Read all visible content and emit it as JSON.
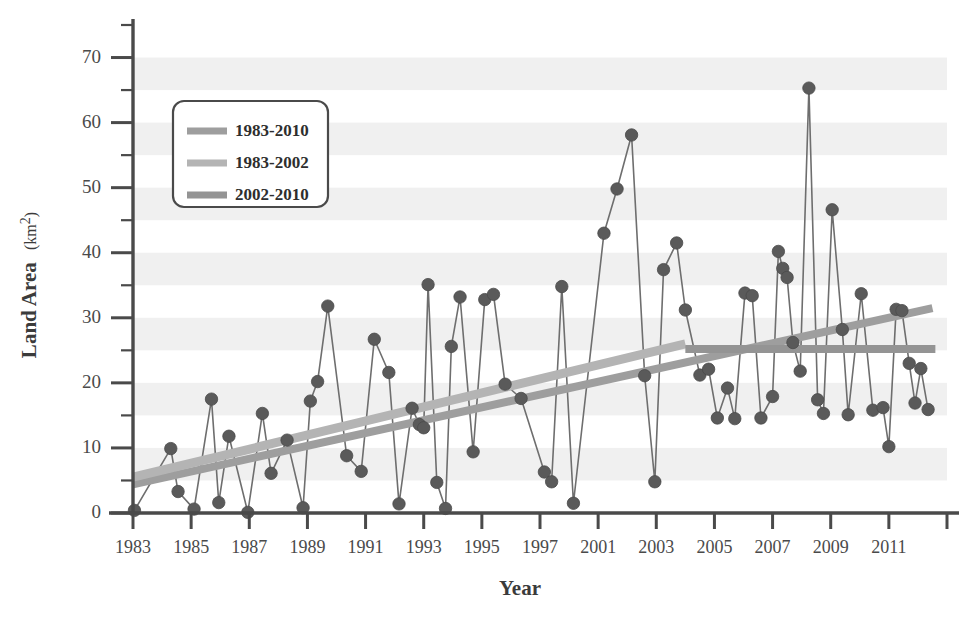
{
  "chart_data": {
    "type": "line",
    "title": "",
    "xlabel": "Year",
    "ylabel": "Land Area (km²)",
    "ylabel_main": "Land Area",
    "ylabel_unit": "(km",
    "ylabel_sup": "2",
    "ylabel_unit_close": ")",
    "xlim": [
      1983,
      2011
    ],
    "ylim": [
      0,
      75
    ],
    "yticks": [
      0,
      10,
      20,
      30,
      40,
      50,
      60,
      70
    ],
    "ytick_labels": [
      "0",
      "10",
      "20",
      "30",
      "40",
      "50",
      "60",
      "70"
    ],
    "yminor_step": 5,
    "xticks": [
      1983,
      1985,
      1987,
      1989,
      1991,
      1993,
      1995,
      1997,
      1999,
      2001,
      2003,
      2005,
      2007,
      2009,
      2011
    ],
    "xtick_labels": [
      "1983",
      "1985",
      "1987",
      "1989",
      "1991",
      "1993",
      "1995",
      "1997",
      "2001",
      "2003",
      "2005",
      "2007",
      "2009",
      "2011"
    ],
    "grid": "horizontal-bands",
    "band_color": "#f0f0f0",
    "marker_color": "#5a5a5a",
    "line_color": "#6e6e6e",
    "axis_color": "#4a4a4a",
    "legend_position": "top-left",
    "series": [
      {
        "name": "observations",
        "marker": "circle",
        "points": [
          [
            1983.05,
            0.4
          ],
          [
            1984.3,
            9.9
          ],
          [
            1984.55,
            3.3
          ],
          [
            1985.1,
            0.6
          ],
          [
            1985.7,
            17.5
          ],
          [
            1985.95,
            1.6
          ],
          [
            1986.3,
            11.8
          ],
          [
            1986.95,
            0.1
          ],
          [
            1987.45,
            15.3
          ],
          [
            1987.75,
            6.1
          ],
          [
            1988.3,
            11.2
          ],
          [
            1988.85,
            0.8
          ],
          [
            1989.1,
            17.2
          ],
          [
            1989.35,
            20.2
          ],
          [
            1989.7,
            31.8
          ],
          [
            1990.35,
            8.8
          ],
          [
            1990.85,
            6.4
          ],
          [
            1991.3,
            26.7
          ],
          [
            1991.8,
            21.6
          ],
          [
            1992.15,
            1.4
          ],
          [
            1992.6,
            16.1
          ],
          [
            1992.85,
            13.6
          ],
          [
            1993.0,
            13.1
          ],
          [
            1993.15,
            35.1
          ],
          [
            1993.45,
            4.7
          ],
          [
            1993.75,
            0.7
          ],
          [
            1993.95,
            25.6
          ],
          [
            1994.25,
            33.2
          ],
          [
            1994.7,
            9.4
          ],
          [
            1995.1,
            32.8
          ],
          [
            1995.4,
            33.6
          ],
          [
            1995.8,
            19.8
          ],
          [
            1996.35,
            17.6
          ],
          [
            1997.15,
            6.3
          ],
          [
            1997.4,
            4.8
          ],
          [
            1997.75,
            34.8
          ],
          [
            1998.15,
            1.5
          ],
          [
            1999.2,
            43.0
          ],
          [
            1999.65,
            49.8
          ],
          [
            2000.15,
            58.1
          ],
          [
            2000.6,
            21.1
          ],
          [
            2000.95,
            4.8
          ],
          [
            2001.25,
            37.4
          ],
          [
            2001.7,
            41.5
          ],
          [
            2002.0,
            31.2
          ],
          [
            2002.5,
            21.2
          ],
          [
            2002.8,
            22.1
          ],
          [
            2003.1,
            14.6
          ],
          [
            2003.45,
            19.2
          ],
          [
            2003.7,
            14.5
          ],
          [
            2004.05,
            33.8
          ],
          [
            2004.3,
            33.4
          ],
          [
            2004.6,
            14.6
          ],
          [
            2005.0,
            17.9
          ],
          [
            2005.2,
            40.2
          ],
          [
            2005.35,
            37.6
          ],
          [
            2005.5,
            36.2
          ],
          [
            2005.7,
            26.2
          ],
          [
            2005.95,
            21.8
          ],
          [
            2006.25,
            65.3
          ],
          [
            2006.55,
            17.4
          ],
          [
            2006.75,
            15.3
          ],
          [
            2007.05,
            46.6
          ],
          [
            2007.4,
            28.2
          ],
          [
            2007.6,
            15.1
          ],
          [
            2008.05,
            33.7
          ],
          [
            2008.45,
            15.8
          ],
          [
            2008.8,
            16.2
          ],
          [
            2009.0,
            10.2
          ],
          [
            2009.25,
            31.3
          ],
          [
            2009.45,
            31.1
          ],
          [
            2009.7,
            23.0
          ],
          [
            2009.9,
            16.9
          ],
          [
            2010.1,
            22.2
          ],
          [
            2010.35,
            15.9
          ]
        ]
      }
    ],
    "trend_lines": [
      {
        "name": "1983-2010",
        "label": "1983-2010",
        "color": "#9e9e9e",
        "x_start": 1983,
        "y_start": 4.4,
        "x_end": 2010.5,
        "y_end": 31.5,
        "width": 8
      },
      {
        "name": "1983-2002",
        "label": "1983-2002",
        "color": "#b4b4b4",
        "x_start": 1983,
        "y_start": 5.5,
        "x_end": 2002.0,
        "y_end": 26.0,
        "width": 9
      },
      {
        "name": "2002-2010",
        "label": "2002-2010",
        "color": "#949494",
        "x_start": 2002.0,
        "y_start": 25.2,
        "x_end": 2010.6,
        "y_end": 25.2,
        "width": 8
      }
    ],
    "legend": {
      "entries": [
        {
          "label": "1983-2010",
          "color": "#9e9e9e"
        },
        {
          "label": "1983-2002",
          "color": "#b4b4b4"
        },
        {
          "label": "2002-2010",
          "color": "#949494"
        }
      ]
    }
  }
}
